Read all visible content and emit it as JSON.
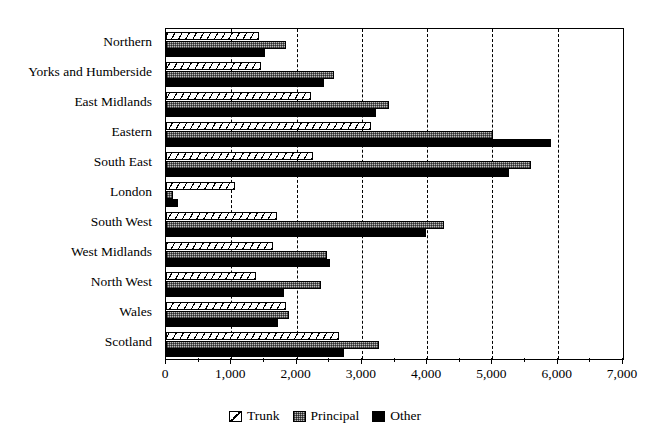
{
  "chart_data": {
    "type": "bar",
    "orientation": "horizontal",
    "title": "",
    "xlabel": "",
    "ylabel": "",
    "xlim": [
      0,
      7000
    ],
    "xticks": [
      0,
      1000,
      2000,
      3000,
      4000,
      5000,
      6000,
      7000
    ],
    "xtick_labels": [
      "0",
      "1,000",
      "2,000",
      "3,000",
      "4,000",
      "5,000",
      "6,000",
      "7,000"
    ],
    "grid": "vertical-dashed",
    "legend_position": "bottom-center",
    "categories": [
      "Northern",
      "Yorks and Humberside",
      "East Midlands",
      "Eastern",
      "South East",
      "London",
      "South West",
      "West Midlands",
      "North West",
      "Wales",
      "Scotland"
    ],
    "series": [
      {
        "name": "Trunk",
        "values": [
          1430,
          1450,
          2220,
          3140,
          2250,
          1060,
          1700,
          1640,
          1380,
          1840,
          2650
        ]
      },
      {
        "name": "Principal",
        "values": [
          1840,
          2570,
          3410,
          5010,
          5590,
          100,
          4260,
          2470,
          2370,
          1880,
          3260
        ]
      },
      {
        "name": "Other",
        "values": [
          1520,
          2420,
          3220,
          5900,
          5250,
          190,
          3980,
          2510,
          1810,
          1720,
          2730
        ]
      }
    ]
  },
  "legend": {
    "items": [
      {
        "label": "Trunk",
        "pattern": "diagonal-hatch",
        "color": "#ffffff"
      },
      {
        "label": "Principal",
        "pattern": "dotted-grey",
        "color": "#b9b9b9"
      },
      {
        "label": "Other",
        "pattern": "solid",
        "color": "#000000"
      }
    ]
  }
}
